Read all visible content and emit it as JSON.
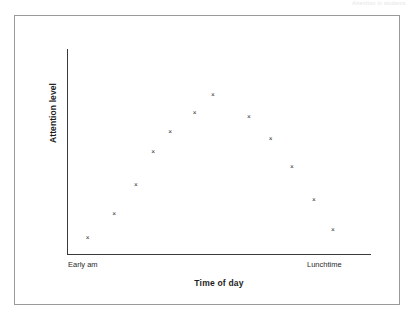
{
  "scan_header_text": "Attention in students",
  "chart_data": {
    "type": "scatter",
    "title": "",
    "xlabel": "Time of day",
    "ylabel": "Attention level",
    "xlim": [
      0,
      1
    ],
    "ylim": [
      0,
      1
    ],
    "grid": false,
    "legend": null,
    "marker_symbol": "×",
    "xtick_labels": [
      "Early am",
      "Lunchtime"
    ],
    "xtick_positions": [
      0.02,
      0.82
    ],
    "ytick_labels": [],
    "axis_color": "#3a3a3a",
    "marker_color": "#2b2b2b",
    "points": [
      {
        "x": 0.068,
        "y": 0.08
      },
      {
        "x": 0.155,
        "y": 0.205
      },
      {
        "x": 0.227,
        "y": 0.352
      },
      {
        "x": 0.283,
        "y": 0.518
      },
      {
        "x": 0.339,
        "y": 0.62
      },
      {
        "x": 0.42,
        "y": 0.718
      },
      {
        "x": 0.48,
        "y": 0.81
      },
      {
        "x": 0.598,
        "y": 0.7
      },
      {
        "x": 0.67,
        "y": 0.588
      },
      {
        "x": 0.74,
        "y": 0.442
      },
      {
        "x": 0.812,
        "y": 0.275
      },
      {
        "x": 0.875,
        "y": 0.12
      }
    ]
  }
}
